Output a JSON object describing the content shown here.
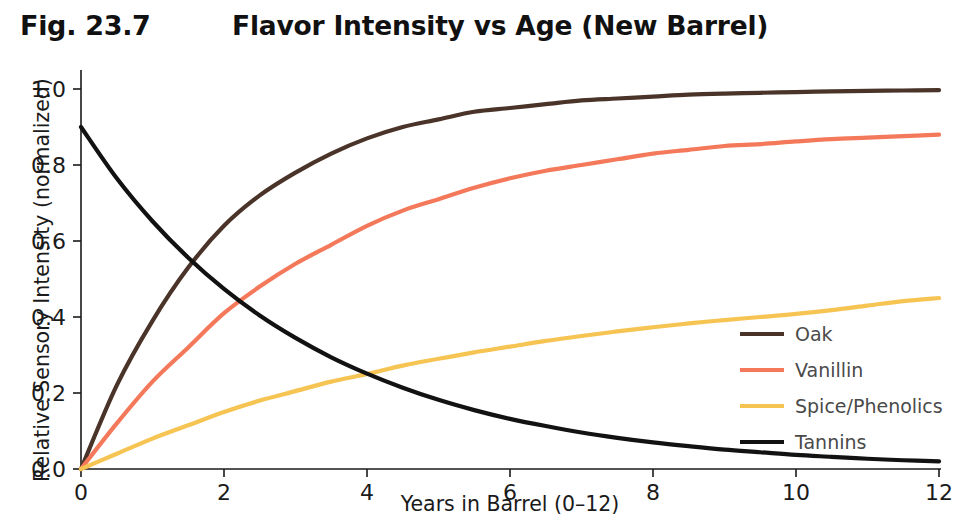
{
  "figure": {
    "number_label": "Fig. 23.7",
    "title": "Flavor Intensity vs Age (New Barrel)"
  },
  "axes": {
    "xlabel": "Years in Barrel (0–12)",
    "ylabel": "Relative Sensory Intensity (normalized)",
    "xticks": [
      "0",
      "2",
      "4",
      "6",
      "8",
      "10",
      "12"
    ],
    "yticks": [
      "0.0",
      "0.2",
      "0.4",
      "0.6",
      "0.8",
      "1.0"
    ]
  },
  "legend": {
    "position": "center-right",
    "entries": [
      {
        "label": "Oak",
        "color": "#4a3328"
      },
      {
        "label": "Vanillin",
        "color": "#f4795b"
      },
      {
        "label": "Spice/Phenolics",
        "color": "#f6c453"
      },
      {
        "label": "Tannins",
        "color": "#121212"
      }
    ]
  },
  "chart_data": {
    "type": "line",
    "title": "Flavor Intensity vs Age (New Barrel)",
    "xlabel": "Years in Barrel (0–12)",
    "ylabel": "Relative Sensory Intensity (normalized)",
    "xlim": [
      0,
      12
    ],
    "ylim": [
      0.0,
      1.0
    ],
    "grid": false,
    "legend_position": "center-right",
    "x": [
      0,
      0.5,
      1,
      1.5,
      2,
      2.5,
      3,
      3.5,
      4,
      4.5,
      5,
      5.5,
      6,
      6.5,
      7,
      7.5,
      8,
      8.5,
      9,
      9.5,
      10,
      10.5,
      11,
      11.5,
      12
    ],
    "series": [
      {
        "name": "Oak",
        "color": "#4a3328",
        "values": [
          0.0,
          0.22,
          0.39,
          0.53,
          0.64,
          0.72,
          0.78,
          0.83,
          0.87,
          0.9,
          0.92,
          0.94,
          0.95,
          0.96,
          0.97,
          0.975,
          0.98,
          0.985,
          0.988,
          0.99,
          0.992,
          0.994,
          0.995,
          0.996,
          0.997
        ]
      },
      {
        "name": "Vanillin",
        "color": "#f4795b",
        "values": [
          0.0,
          0.12,
          0.23,
          0.32,
          0.41,
          0.48,
          0.54,
          0.59,
          0.64,
          0.68,
          0.71,
          0.74,
          0.765,
          0.785,
          0.8,
          0.815,
          0.83,
          0.84,
          0.85,
          0.855,
          0.862,
          0.868,
          0.872,
          0.876,
          0.88
        ]
      },
      {
        "name": "Spice/Phenolics",
        "color": "#f6c453",
        "values": [
          0.0,
          0.04,
          0.08,
          0.115,
          0.15,
          0.18,
          0.205,
          0.23,
          0.25,
          0.272,
          0.29,
          0.307,
          0.322,
          0.337,
          0.35,
          0.362,
          0.373,
          0.383,
          0.392,
          0.4,
          0.408,
          0.418,
          0.43,
          0.442,
          0.45
        ]
      },
      {
        "name": "Tannins",
        "color": "#121212",
        "values": [
          0.9,
          0.765,
          0.652,
          0.556,
          0.474,
          0.404,
          0.345,
          0.294,
          0.251,
          0.214,
          0.182,
          0.155,
          0.132,
          0.113,
          0.096,
          0.082,
          0.07,
          0.06,
          0.051,
          0.044,
          0.037,
          0.032,
          0.027,
          0.023,
          0.02
        ]
      }
    ]
  }
}
